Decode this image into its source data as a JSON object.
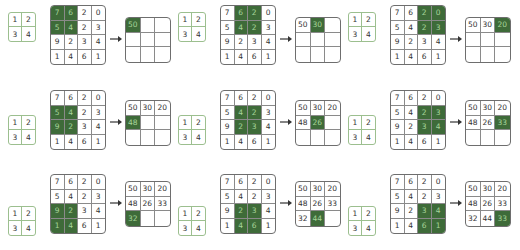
{
  "colors": {
    "highlight": "#3e6b39",
    "highlight_text": "#a7d59a",
    "kernel_border": "#9cbf8f",
    "grid_border": "#6e6e6e"
  },
  "kernel": [
    [
      "1",
      "2"
    ],
    [
      "3",
      "4"
    ]
  ],
  "input": [
    [
      "7",
      "6",
      "2",
      "0"
    ],
    [
      "5",
      "4",
      "2",
      "3"
    ],
    [
      "9",
      "2",
      "3",
      "4"
    ],
    [
      "1",
      "4",
      "6",
      "1"
    ]
  ],
  "output_full": [
    [
      "50",
      "30",
      "20"
    ],
    [
      "48",
      "26",
      "33"
    ],
    [
      "32",
      "44",
      "33"
    ]
  ],
  "arrow_icon": "right-arrow-icon",
  "steps": [
    {
      "window": [
        0,
        0
      ],
      "output_cell": [
        0,
        0
      ],
      "output": [
        [
          "50",
          "",
          ""
        ],
        [
          "",
          "",
          ""
        ],
        [
          "",
          "",
          ""
        ]
      ]
    },
    {
      "window": [
        0,
        1
      ],
      "output_cell": [
        0,
        1
      ],
      "output": [
        [
          "50",
          "30",
          ""
        ],
        [
          "",
          "",
          ""
        ],
        [
          "",
          "",
          ""
        ]
      ]
    },
    {
      "window": [
        0,
        2
      ],
      "output_cell": [
        0,
        2
      ],
      "output": [
        [
          "50",
          "30",
          "20"
        ],
        [
          "",
          "",
          ""
        ],
        [
          "",
          "",
          ""
        ]
      ]
    },
    {
      "window": [
        1,
        0
      ],
      "output_cell": [
        1,
        0
      ],
      "output": [
        [
          "50",
          "30",
          "20"
        ],
        [
          "48",
          "",
          ""
        ],
        [
          "",
          "",
          ""
        ]
      ]
    },
    {
      "window": [
        1,
        1
      ],
      "output_cell": [
        1,
        1
      ],
      "output": [
        [
          "50",
          "30",
          "20"
        ],
        [
          "48",
          "26",
          ""
        ],
        [
          "",
          "",
          ""
        ]
      ]
    },
    {
      "window": [
        1,
        2
      ],
      "output_cell": [
        1,
        2
      ],
      "output": [
        [
          "50",
          "30",
          "20"
        ],
        [
          "48",
          "26",
          "33"
        ],
        [
          "",
          "",
          ""
        ]
      ]
    },
    {
      "window": [
        2,
        0
      ],
      "output_cell": [
        2,
        0
      ],
      "output": [
        [
          "50",
          "30",
          "20"
        ],
        [
          "48",
          "26",
          "33"
        ],
        [
          "32",
          "",
          ""
        ]
      ]
    },
    {
      "window": [
        2,
        1
      ],
      "output_cell": [
        2,
        1
      ],
      "output": [
        [
          "50",
          "30",
          "20"
        ],
        [
          "48",
          "26",
          "33"
        ],
        [
          "32",
          "44",
          ""
        ]
      ]
    },
    {
      "window": [
        2,
        2
      ],
      "output_cell": [
        2,
        2
      ],
      "output": [
        [
          "50",
          "30",
          "20"
        ],
        [
          "48",
          "26",
          "33"
        ],
        [
          "32",
          "44",
          "33"
        ]
      ]
    }
  ]
}
